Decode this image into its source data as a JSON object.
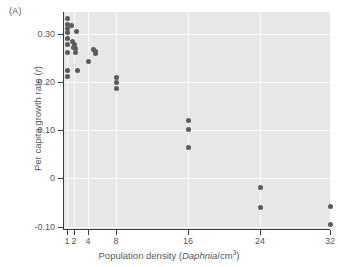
{
  "figure": {
    "panel_label": "(A)"
  },
  "chart_data": {
    "type": "scatter",
    "title": "",
    "panel": "(A)",
    "xlabel": "Population density (Daphnia/cm3)",
    "xlabel_parts": {
      "prefix": "Population density (",
      "italic": "Daphnia",
      "middle": "/cm",
      "superscript": "3",
      "suffix": ")"
    },
    "ylabel": "Per capita growth rate (r)",
    "ylabel_parts": {
      "prefix": "Per capita growth rate (",
      "italic": "r",
      "suffix": ")"
    },
    "xticks": [
      1,
      2,
      4,
      8,
      16,
      24,
      32
    ],
    "xtick_labels": [
      "1",
      "2",
      "4",
      "8",
      "16",
      "24",
      "32"
    ],
    "yticks": [
      -0.1,
      0,
      0.1,
      0.2,
      0.3
    ],
    "ytick_labels": [
      "-0.10",
      "0",
      "0.10",
      "0.20",
      "0.30"
    ],
    "xlim": [
      0.6,
      34
    ],
    "ylim": [
      -0.105,
      0.345
    ],
    "grid": true,
    "grid_color": "#fdfdfd",
    "plot_background": "#e7e7e7",
    "marker_color": "#5b5b5d",
    "marker_shape": "circle",
    "legend": null,
    "points": [
      {
        "x": 1,
        "y": 0.332
      },
      {
        "x": 1,
        "y": 0.32
      },
      {
        "x": 1,
        "y": 0.31
      },
      {
        "x": 1,
        "y": 0.302
      },
      {
        "x": 1,
        "y": 0.291
      },
      {
        "x": 1,
        "y": 0.277
      },
      {
        "x": 1,
        "y": 0.262
      },
      {
        "x": 1,
        "y": 0.224
      },
      {
        "x": 1,
        "y": 0.211
      },
      {
        "x": 1.6,
        "y": 0.317
      },
      {
        "x": 1.8,
        "y": 0.283
      },
      {
        "x": 1.9,
        "y": 0.272
      },
      {
        "x": 2.05,
        "y": 0.277
      },
      {
        "x": 2.15,
        "y": 0.27
      },
      {
        "x": 2.2,
        "y": 0.262
      },
      {
        "x": 2.4,
        "y": 0.305
      },
      {
        "x": 2.5,
        "y": 0.223
      },
      {
        "x": 4.0,
        "y": 0.242
      },
      {
        "x": 4.8,
        "y": 0.268
      },
      {
        "x": 5.0,
        "y": 0.263
      },
      {
        "x": 5.1,
        "y": 0.258
      },
      {
        "x": 8,
        "y": 0.209
      },
      {
        "x": 8,
        "y": 0.199
      },
      {
        "x": 8,
        "y": 0.186
      },
      {
        "x": 16,
        "y": 0.12
      },
      {
        "x": 16,
        "y": 0.102
      },
      {
        "x": 16,
        "y": 0.065
      },
      {
        "x": 24,
        "y": -0.018
      },
      {
        "x": 24,
        "y": -0.06
      },
      {
        "x": 32,
        "y": -0.058
      },
      {
        "x": 32,
        "y": -0.095
      }
    ]
  }
}
